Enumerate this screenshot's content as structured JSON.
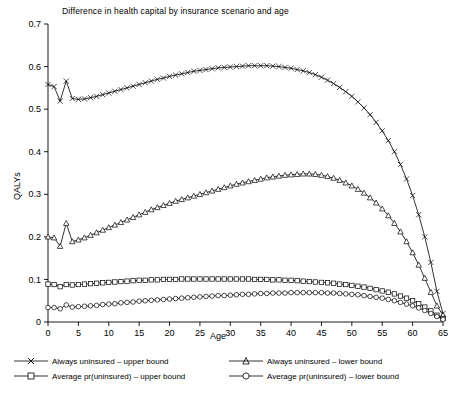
{
  "chart_data": {
    "type": "line",
    "title": "Difference in health capital by insurance scenario and age",
    "xlabel": "Age",
    "ylabel": "QALYs",
    "xlim": [
      0,
      65
    ],
    "ylim": [
      0,
      0.7
    ],
    "xticks": [
      0,
      5,
      10,
      15,
      20,
      25,
      30,
      35,
      40,
      45,
      50,
      55,
      60,
      65
    ],
    "yticks": [
      "0",
      "0.1",
      "0.2",
      "0.3",
      "0.4",
      "0.5",
      "0.6",
      "0.7"
    ],
    "grid": false,
    "legend_position": "bottom",
    "series": [
      {
        "name": "Always uninsured – upper bound",
        "marker": "x",
        "x": [
          0,
          1,
          2,
          3,
          4,
          5,
          6,
          7,
          8,
          9,
          10,
          11,
          12,
          13,
          14,
          15,
          16,
          17,
          18,
          19,
          20,
          21,
          22,
          23,
          24,
          25,
          26,
          27,
          28,
          29,
          30,
          31,
          32,
          33,
          34,
          35,
          36,
          37,
          38,
          39,
          40,
          41,
          42,
          43,
          44,
          45,
          46,
          47,
          48,
          49,
          50,
          51,
          52,
          53,
          54,
          55,
          56,
          57,
          58,
          59,
          60,
          61,
          62,
          63,
          64,
          65
        ],
        "y": [
          0.558,
          0.553,
          0.519,
          0.566,
          0.525,
          0.523,
          0.524,
          0.527,
          0.53,
          0.534,
          0.538,
          0.542,
          0.546,
          0.55,
          0.554,
          0.558,
          0.562,
          0.566,
          0.57,
          0.573,
          0.577,
          0.58,
          0.583,
          0.586,
          0.589,
          0.591,
          0.593,
          0.595,
          0.597,
          0.598,
          0.599,
          0.6,
          0.601,
          0.602,
          0.602,
          0.602,
          0.602,
          0.601,
          0.6,
          0.598,
          0.596,
          0.593,
          0.59,
          0.586,
          0.581,
          0.575,
          0.568,
          0.56,
          0.551,
          0.541,
          0.53,
          0.517,
          0.503,
          0.487,
          0.469,
          0.449,
          0.426,
          0.4,
          0.37,
          0.336,
          0.297,
          0.252,
          0.2,
          0.14,
          0.072,
          0.02
        ]
      },
      {
        "name": "Always uninsured – lower bound",
        "marker": "triangle",
        "x": [
          0,
          1,
          2,
          3,
          4,
          5,
          6,
          7,
          8,
          9,
          10,
          11,
          12,
          13,
          14,
          15,
          16,
          17,
          18,
          19,
          20,
          21,
          22,
          23,
          24,
          25,
          26,
          27,
          28,
          29,
          30,
          31,
          32,
          33,
          34,
          35,
          36,
          37,
          38,
          39,
          40,
          41,
          42,
          43,
          44,
          45,
          46,
          47,
          48,
          49,
          50,
          51,
          52,
          53,
          54,
          55,
          56,
          57,
          58,
          59,
          60,
          61,
          62,
          63,
          64,
          65
        ],
        "y": [
          0.2,
          0.198,
          0.178,
          0.232,
          0.189,
          0.193,
          0.198,
          0.204,
          0.21,
          0.216,
          0.222,
          0.228,
          0.234,
          0.24,
          0.246,
          0.252,
          0.258,
          0.264,
          0.269,
          0.274,
          0.279,
          0.284,
          0.288,
          0.292,
          0.296,
          0.3,
          0.304,
          0.308,
          0.312,
          0.316,
          0.32,
          0.324,
          0.327,
          0.33,
          0.333,
          0.336,
          0.339,
          0.341,
          0.343,
          0.345,
          0.346,
          0.347,
          0.348,
          0.348,
          0.347,
          0.345,
          0.342,
          0.338,
          0.333,
          0.327,
          0.32,
          0.312,
          0.303,
          0.292,
          0.28,
          0.266,
          0.25,
          0.232,
          0.212,
          0.189,
          0.163,
          0.134,
          0.103,
          0.07,
          0.038,
          0.016
        ]
      },
      {
        "name": "Average pr(uninsured) – upper bound",
        "marker": "square",
        "x": [
          0,
          1,
          2,
          3,
          4,
          5,
          6,
          7,
          8,
          9,
          10,
          11,
          12,
          13,
          14,
          15,
          16,
          17,
          18,
          19,
          20,
          21,
          22,
          23,
          24,
          25,
          26,
          27,
          28,
          29,
          30,
          31,
          32,
          33,
          34,
          35,
          36,
          37,
          38,
          39,
          40,
          41,
          42,
          43,
          44,
          45,
          46,
          47,
          48,
          49,
          50,
          51,
          52,
          53,
          54,
          55,
          56,
          57,
          58,
          59,
          60,
          61,
          62,
          63,
          64,
          65
        ],
        "y": [
          0.089,
          0.088,
          0.083,
          0.088,
          0.087,
          0.088,
          0.089,
          0.09,
          0.091,
          0.092,
          0.093,
          0.094,
          0.095,
          0.096,
          0.097,
          0.098,
          0.098,
          0.099,
          0.099,
          0.1,
          0.1,
          0.1,
          0.101,
          0.101,
          0.101,
          0.101,
          0.101,
          0.101,
          0.101,
          0.101,
          0.101,
          0.101,
          0.101,
          0.101,
          0.1,
          0.1,
          0.1,
          0.099,
          0.099,
          0.098,
          0.098,
          0.097,
          0.096,
          0.095,
          0.094,
          0.093,
          0.092,
          0.091,
          0.089,
          0.088,
          0.086,
          0.084,
          0.082,
          0.079,
          0.076,
          0.073,
          0.07,
          0.066,
          0.061,
          0.056,
          0.05,
          0.043,
          0.035,
          0.026,
          0.016,
          0.008
        ]
      },
      {
        "name": "Average pr(uninsured) – lower bound",
        "marker": "circle",
        "x": [
          0,
          1,
          2,
          3,
          4,
          5,
          6,
          7,
          8,
          9,
          10,
          11,
          12,
          13,
          14,
          15,
          16,
          17,
          18,
          19,
          20,
          21,
          22,
          23,
          24,
          25,
          26,
          27,
          28,
          29,
          30,
          31,
          32,
          33,
          34,
          35,
          36,
          37,
          38,
          39,
          40,
          41,
          42,
          43,
          44,
          45,
          46,
          47,
          48,
          49,
          50,
          51,
          52,
          53,
          54,
          55,
          56,
          57,
          58,
          59,
          60,
          61,
          62,
          63,
          64,
          65
        ],
        "y": [
          0.034,
          0.034,
          0.031,
          0.04,
          0.035,
          0.036,
          0.037,
          0.038,
          0.039,
          0.041,
          0.042,
          0.043,
          0.045,
          0.046,
          0.047,
          0.049,
          0.05,
          0.051,
          0.052,
          0.053,
          0.054,
          0.055,
          0.056,
          0.057,
          0.058,
          0.059,
          0.06,
          0.061,
          0.062,
          0.062,
          0.063,
          0.064,
          0.065,
          0.065,
          0.066,
          0.067,
          0.067,
          0.068,
          0.068,
          0.068,
          0.069,
          0.069,
          0.069,
          0.069,
          0.069,
          0.069,
          0.068,
          0.068,
          0.067,
          0.066,
          0.065,
          0.064,
          0.062,
          0.06,
          0.058,
          0.056,
          0.053,
          0.05,
          0.046,
          0.042,
          0.038,
          0.033,
          0.027,
          0.02,
          0.013,
          0.006
        ]
      }
    ]
  },
  "legend": [
    {
      "label": "Always uninsured – upper bound",
      "marker": "x"
    },
    {
      "label": "Always uninsured – lower bound",
      "marker": "triangle"
    },
    {
      "label": "Average pr(uninsured) – upper bound",
      "marker": "square"
    },
    {
      "label": "Average pr(uninsured) – lower bound",
      "marker": "circle"
    }
  ]
}
